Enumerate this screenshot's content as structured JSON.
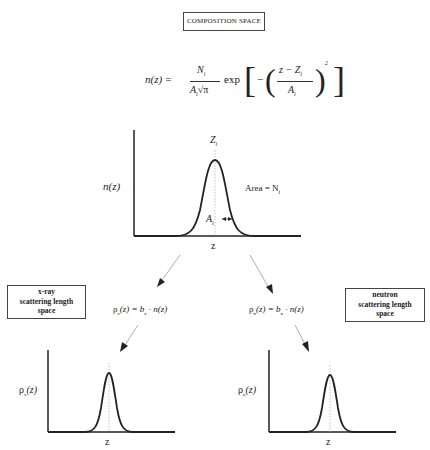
{
  "title": "COMPOSITION SPACE",
  "equation": {
    "lhs": "n(z) =",
    "numerator": "N",
    "numerator_sub": "i",
    "denominator": "A",
    "denominator_sub": "i",
    "sqrt": "√π",
    "exp": "exp",
    "inner_minus": "−",
    "frac_num": "z − Z",
    "frac_num_sub": "i",
    "frac_den": "A",
    "frac_den_sub": "i",
    "power": "2"
  },
  "main_plot": {
    "ylabel": "n(z)",
    "xlabel": "z",
    "peak_label": "Z",
    "peak_sub": "i",
    "area_label": "Area = N",
    "area_sub": "i",
    "width_label": "A",
    "width_sub": "i"
  },
  "xray": {
    "box": [
      "x-ray",
      "scattering length",
      "space"
    ],
    "equation": "ρ",
    "eq_sub": "x",
    "eq_rest": "(z) = b",
    "eq_b_sub": "x",
    "eq_tail": " · n(z)",
    "ylabel": "ρ",
    "ylabel_sub": "x",
    "ylabel_rest": "(z)",
    "xlabel": "z"
  },
  "neutron": {
    "box": [
      "neutron",
      "scattering length",
      "space"
    ],
    "equation": "ρ",
    "eq_sub": "n",
    "eq_rest": "(z) = b",
    "eq_b_sub": "n",
    "eq_tail": " · n(z)",
    "ylabel": "ρ",
    "ylabel_sub": "n",
    "ylabel_rest": "(z)",
    "xlabel": "z"
  }
}
